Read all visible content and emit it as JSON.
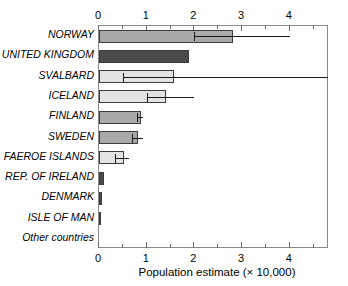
{
  "chart_data": {
    "type": "bar",
    "orientation": "horizontal",
    "title": "",
    "xlabel": "Population estimate (× 10,000)",
    "ylabel": "",
    "xlim": [
      0,
      4.82
    ],
    "grid": false,
    "legend": "none",
    "x_ticks_major": [
      0,
      1,
      2,
      3,
      4
    ],
    "x_ticks_minor": [
      0.5,
      1.5,
      2.5,
      3.5,
      4.5
    ],
    "x_tick_labels": [
      "0",
      "1",
      "2",
      "3",
      "4"
    ],
    "axis_top": true,
    "axis_bottom": true,
    "categories": [
      "NORWAY",
      "UNITED KINGDOM",
      "SVALBARD",
      "ICELAND",
      "FINLAND",
      "SWEDEN",
      "FAEROE ISLANDS",
      "REP. OF IRELAND",
      "DENMARK",
      "ISLE OF MAN",
      "Other countries"
    ],
    "values": [
      2.8,
      1.88,
      1.58,
      1.4,
      0.88,
      0.82,
      0.52,
      0.11,
      0.06,
      0.03,
      0.0
    ],
    "error_low": [
      2.0,
      null,
      0.5,
      1.0,
      0.8,
      0.7,
      0.33,
      null,
      null,
      null,
      null
    ],
    "error_high": [
      4.0,
      null,
      5.0,
      2.0,
      0.92,
      0.92,
      0.62,
      null,
      null,
      null,
      null
    ],
    "bar_colors": [
      "#a9a9a9",
      "#4b4b4b",
      "#e3e3e3",
      "#e3e3e3",
      "#a9a9a9",
      "#a9a9a9",
      "#e3e3e3",
      "#4b4b4b",
      "#4b4b4b",
      "#4b4b4b",
      "#e3e3e3"
    ],
    "bar_edge_color": "#3b3b3b",
    "error_color": "#1a1a1a",
    "frame_color": "#8a8a8a"
  }
}
